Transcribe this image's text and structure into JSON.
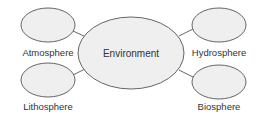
{
  "diagram": {
    "type": "hub-and-spoke",
    "center": {
      "id": "environment",
      "label": "Environment"
    },
    "nodes": [
      {
        "id": "atmosphere",
        "label": "Atmosphere",
        "position": "top-left"
      },
      {
        "id": "hydrosphere",
        "label": "Hydrosphere",
        "position": "top-right"
      },
      {
        "id": "lithosphere",
        "label": "Lithosphere",
        "position": "bottom-left"
      },
      {
        "id": "biosphere",
        "label": "Biosphere",
        "position": "bottom-right"
      }
    ],
    "edges": [
      {
        "from": "environment",
        "to": "atmosphere"
      },
      {
        "from": "environment",
        "to": "hydrosphere"
      },
      {
        "from": "environment",
        "to": "lithosphere"
      },
      {
        "from": "environment",
        "to": "biosphere"
      }
    ],
    "colors": {
      "fill": "#efefef",
      "stroke": "#555555",
      "text": "#333333"
    }
  }
}
